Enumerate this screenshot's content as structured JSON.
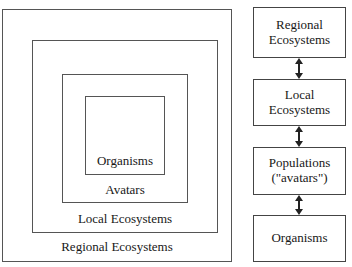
{
  "nested_panel": {
    "description": "Four concentric rectangles, smallest innermost",
    "rings": [
      {
        "level": 4,
        "label": "Regional Ecosystems"
      },
      {
        "level": 3,
        "label": "Local Ecosystems"
      },
      {
        "level": 2,
        "label": "Avatars"
      },
      {
        "level": 1,
        "label": "Organisms"
      }
    ]
  },
  "stack_panel": {
    "description": "Four boxes linked top-to-bottom by double-headed arrows",
    "boxes": [
      {
        "line1": "Regional",
        "line2": "Ecosystems",
        "text": "Regional\nEcosystems"
      },
      {
        "line1": "Local",
        "line2": "Ecosystems",
        "text": "Local\nEcosystems"
      },
      {
        "line1": "Populations",
        "line2": "(\"avatars\")",
        "text": "Populations\n(\"avatars\")"
      },
      {
        "line1": "Organisms",
        "line2": "",
        "text": "Organisms"
      }
    ],
    "connectors": [
      {
        "from": "Regional Ecosystems",
        "to": "Local Ecosystems",
        "kind": "double-headed-arrow"
      },
      {
        "from": "Local Ecosystems",
        "to": "Populations (\"avatars\")",
        "kind": "double-headed-arrow"
      },
      {
        "from": "Populations (\"avatars\")",
        "to": "Organisms",
        "kind": "double-headed-arrow"
      }
    ]
  },
  "colors": {
    "background": "#ffffff",
    "stroke": "#444444",
    "nested_stroke": "#555555",
    "text": "#181818"
  }
}
